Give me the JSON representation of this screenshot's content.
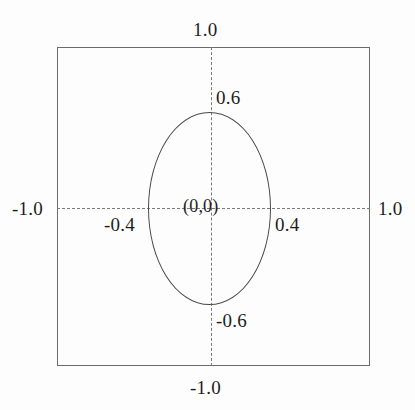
{
  "figure": {
    "type": "geometric-diagram",
    "background_color": "#fdfdfd",
    "boundary_color": "#6b6b6b",
    "curve_color": "#4a4a4a",
    "axis_color": "#7a7a7a",
    "text_color": "#1d1d1d"
  },
  "labels": {
    "box_top": "1.0",
    "box_bottom": "-1.0",
    "box_left": "-1.0",
    "box_right": "1.0",
    "ellipse_top": "0.6",
    "ellipse_bottom": "-0.6",
    "ellipse_left": "-0.4",
    "ellipse_right": "0.4",
    "center": "(0,0)"
  },
  "chart_data": {
    "type": "scatter",
    "title": "",
    "xlabel": "",
    "ylabel": "",
    "xlim": [
      -1.0,
      1.0
    ],
    "ylim": [
      -1.0,
      1.0
    ],
    "grid": false,
    "legend": null,
    "shapes": [
      {
        "name": "domain-square",
        "kind": "rectangle",
        "x_min": -1.0,
        "x_max": 1.0,
        "y_min": -1.0,
        "y_max": 1.0,
        "stroke": "#6b6b6b",
        "fill": "none",
        "linestyle": "solid"
      },
      {
        "name": "ellipse",
        "kind": "ellipse",
        "center": [
          0.0,
          0.0
        ],
        "semi_axis_x": 0.4,
        "semi_axis_y": 0.6,
        "stroke": "#4a4a4a",
        "fill": "none",
        "linestyle": "solid"
      },
      {
        "name": "x-axis",
        "kind": "line",
        "from": [
          -1.0,
          0.0
        ],
        "to": [
          1.0,
          0.0
        ],
        "stroke": "#7a7a7a",
        "linestyle": "dashed"
      },
      {
        "name": "y-axis",
        "kind": "line",
        "from": [
          0.0,
          -1.0
        ],
        "to": [
          0.0,
          1.0
        ],
        "stroke": "#7a7a7a",
        "linestyle": "dashed"
      }
    ],
    "annotations": [
      {
        "text": "1.0",
        "value": 1.0,
        "x": 0.0,
        "y": 1.0,
        "position": "top-outside"
      },
      {
        "text": "-1.0",
        "value": -1.0,
        "x": 0.0,
        "y": -1.0,
        "position": "bottom-outside"
      },
      {
        "text": "-1.0",
        "value": -1.0,
        "x": -1.0,
        "y": 0.0,
        "position": "left-outside"
      },
      {
        "text": "1.0",
        "value": 1.0,
        "x": 1.0,
        "y": 0.0,
        "position": "right-outside"
      },
      {
        "text": "0.6",
        "value": 0.6,
        "x": 0.0,
        "y": 0.6,
        "position": "top-right-inside"
      },
      {
        "text": "-0.6",
        "value": -0.6,
        "x": 0.0,
        "y": -0.6,
        "position": "bottom-right-inside"
      },
      {
        "text": "-0.4",
        "value": -0.4,
        "x": -0.4,
        "y": 0.0,
        "position": "left-below-axis"
      },
      {
        "text": "0.4",
        "value": 0.4,
        "x": 0.4,
        "y": 0.0,
        "position": "right-below-axis"
      },
      {
        "text": "(0,0)",
        "value": null,
        "x": 0.0,
        "y": 0.0,
        "position": "center"
      }
    ]
  }
}
